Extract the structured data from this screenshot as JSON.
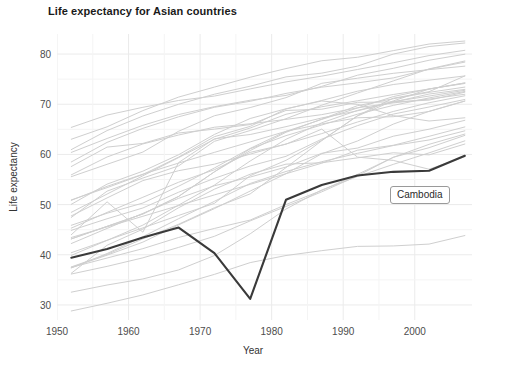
{
  "chart_data": {
    "type": "line",
    "title": "Life expectancy for Asian countries",
    "xlabel": "Year",
    "ylabel": "Life expectancy",
    "xlim": [
      1950,
      2008
    ],
    "ylim": [
      27,
      84
    ],
    "xticks": [
      1950,
      1960,
      1970,
      1980,
      1990,
      2000
    ],
    "yticks": [
      30,
      40,
      50,
      60,
      70,
      80
    ],
    "grid": true,
    "legend": "none",
    "annotations": [
      {
        "label": "Cambodia",
        "x": 1994,
        "y": 52.5
      }
    ],
    "highlight_series": "Cambodia",
    "x": [
      1952,
      1957,
      1962,
      1967,
      1972,
      1977,
      1982,
      1987,
      1992,
      1997,
      2002,
      2007
    ],
    "series": [
      {
        "name": "Cambodia",
        "highlight": true,
        "values": [
          39.42,
          41.17,
          43.42,
          45.42,
          40.32,
          31.22,
          50.96,
          53.91,
          55.8,
          56.53,
          56.75,
          59.72
        ]
      },
      {
        "name": "Afghanistan",
        "highlight": false,
        "values": [
          28.8,
          30.33,
          32.0,
          34.02,
          36.09,
          38.44,
          39.85,
          40.82,
          41.67,
          41.76,
          42.13,
          43.83
        ]
      },
      {
        "name": "Bahrain",
        "highlight": false,
        "values": [
          50.94,
          53.38,
          56.0,
          59.47,
          63.54,
          65.59,
          69.05,
          70.75,
          72.6,
          73.93,
          74.8,
          75.64
        ]
      },
      {
        "name": "Bangladesh",
        "highlight": false,
        "values": [
          37.48,
          39.35,
          41.22,
          43.45,
          45.25,
          46.92,
          50.01,
          52.82,
          56.02,
          59.41,
          62.01,
          64.06
        ]
      },
      {
        "name": "China",
        "highlight": false,
        "values": [
          44.0,
          50.55,
          44.5,
          58.38,
          63.12,
          63.97,
          65.53,
          67.27,
          68.69,
          70.43,
          72.03,
          72.96
        ]
      },
      {
        "name": "Hong Kong, China",
        "highlight": false,
        "values": [
          60.96,
          64.75,
          67.65,
          70.0,
          72.0,
          73.6,
          75.45,
          76.2,
          77.6,
          80.0,
          81.5,
          82.21
        ]
      },
      {
        "name": "India",
        "highlight": false,
        "values": [
          37.37,
          40.25,
          43.61,
          47.19,
          50.65,
          54.21,
          56.6,
          58.55,
          60.22,
          61.77,
          62.88,
          64.7
        ]
      },
      {
        "name": "Indonesia",
        "highlight": false,
        "values": [
          37.47,
          39.92,
          42.52,
          45.96,
          49.2,
          52.7,
          56.16,
          60.14,
          62.68,
          66.04,
          68.59,
          70.65
        ]
      },
      {
        "name": "Iran",
        "highlight": false,
        "values": [
          44.87,
          47.18,
          49.33,
          52.47,
          55.23,
          57.7,
          59.62,
          63.04,
          65.74,
          68.04,
          69.45,
          70.96
        ]
      },
      {
        "name": "Iraq",
        "highlight": false,
        "values": [
          45.32,
          48.44,
          51.46,
          54.46,
          56.95,
          60.41,
          62.04,
          65.04,
          59.46,
          58.81,
          57.05,
          59.55
        ]
      },
      {
        "name": "Israel",
        "highlight": false,
        "values": [
          65.39,
          67.84,
          69.39,
          70.75,
          71.63,
          73.06,
          74.45,
          75.6,
          76.93,
          78.27,
          79.7,
          80.75
        ]
      },
      {
        "name": "Japan",
        "highlight": false,
        "values": [
          63.03,
          65.5,
          68.73,
          71.43,
          73.42,
          75.38,
          77.11,
          78.67,
          79.36,
          80.69,
          82.0,
          82.6
        ]
      },
      {
        "name": "Jordan",
        "highlight": false,
        "values": [
          43.16,
          45.67,
          48.13,
          51.63,
          56.53,
          61.13,
          63.74,
          65.87,
          68.02,
          69.77,
          71.26,
          72.54
        ]
      },
      {
        "name": "Korea, Dem. Rep.",
        "highlight": false,
        "values": [
          50.06,
          54.08,
          56.66,
          59.94,
          63.98,
          67.16,
          69.1,
          70.65,
          69.98,
          67.73,
          66.66,
          67.3
        ]
      },
      {
        "name": "Korea, Rep.",
        "highlight": false,
        "values": [
          47.45,
          52.68,
          55.29,
          57.72,
          62.61,
          64.77,
          67.12,
          69.81,
          72.24,
          74.65,
          77.04,
          78.62
        ]
      },
      {
        "name": "Kuwait",
        "highlight": false,
        "values": [
          55.57,
          58.03,
          60.47,
          64.62,
          67.71,
          69.34,
          71.31,
          74.17,
          75.19,
          76.16,
          76.9,
          77.59
        ]
      },
      {
        "name": "Lebanon",
        "highlight": false,
        "values": [
          55.93,
          59.49,
          62.09,
          63.87,
          65.42,
          66.1,
          66.98,
          67.93,
          69.29,
          70.27,
          71.03,
          71.99
        ]
      },
      {
        "name": "Malaysia",
        "highlight": false,
        "values": [
          48.46,
          52.1,
          55.74,
          59.37,
          63.01,
          65.26,
          68.0,
          69.5,
          70.69,
          71.94,
          73.04,
          74.24
        ]
      },
      {
        "name": "Mongolia",
        "highlight": false,
        "values": [
          42.24,
          45.25,
          48.25,
          51.25,
          53.75,
          55.49,
          57.49,
          60.22,
          61.27,
          63.63,
          65.03,
          66.8
        ]
      },
      {
        "name": "Myanmar",
        "highlight": false,
        "values": [
          36.32,
          41.9,
          45.11,
          49.38,
          53.07,
          56.06,
          58.06,
          58.34,
          59.32,
          60.33,
          59.91,
          62.07
        ]
      },
      {
        "name": "Nepal",
        "highlight": false,
        "values": [
          36.16,
          37.69,
          39.39,
          41.47,
          43.68,
          46.75,
          49.63,
          52.54,
          55.73,
          59.43,
          61.34,
          63.79
        ]
      },
      {
        "name": "Oman",
        "highlight": false,
        "values": [
          37.58,
          40.08,
          43.17,
          46.09,
          49.38,
          52.14,
          57.37,
          62.73,
          67.73,
          71.2,
          72.5,
          75.64
        ]
      },
      {
        "name": "Pakistan",
        "highlight": false,
        "values": [
          43.44,
          45.56,
          47.67,
          49.8,
          51.93,
          54.04,
          56.16,
          58.25,
          60.84,
          61.82,
          63.61,
          65.48
        ]
      },
      {
        "name": "Philippines",
        "highlight": false,
        "values": [
          47.75,
          51.33,
          54.78,
          56.76,
          58.06,
          60.06,
          62.08,
          64.15,
          66.46,
          68.56,
          70.3,
          71.69
        ]
      },
      {
        "name": "Saudi Arabia",
        "highlight": false,
        "values": [
          39.88,
          42.87,
          45.91,
          49.9,
          53.89,
          58.69,
          63.01,
          66.3,
          68.77,
          70.53,
          71.63,
          72.78
        ]
      },
      {
        "name": "Singapore",
        "highlight": false,
        "values": [
          60.4,
          63.18,
          65.8,
          67.95,
          69.52,
          70.8,
          71.76,
          73.56,
          75.79,
          77.16,
          78.77,
          79.97
        ]
      },
      {
        "name": "Sri Lanka",
        "highlight": false,
        "values": [
          57.59,
          61.46,
          62.19,
          64.27,
          65.04,
          65.95,
          68.76,
          69.01,
          70.38,
          70.46,
          70.82,
          72.4
        ]
      },
      {
        "name": "Syria",
        "highlight": false,
        "values": [
          45.88,
          48.28,
          50.31,
          53.66,
          57.3,
          61.2,
          64.59,
          66.97,
          69.25,
          71.53,
          73.05,
          74.14
        ]
      },
      {
        "name": "Taiwan",
        "highlight": false,
        "values": [
          58.5,
          62.4,
          65.2,
          67.5,
          69.39,
          70.59,
          72.16,
          73.4,
          74.26,
          75.25,
          76.99,
          78.4
        ]
      },
      {
        "name": "Thailand",
        "highlight": false,
        "values": [
          50.85,
          53.64,
          56.06,
          58.28,
          60.41,
          62.49,
          64.6,
          66.08,
          67.3,
          67.52,
          68.56,
          70.62
        ]
      },
      {
        "name": "Vietnam",
        "highlight": false,
        "values": [
          40.41,
          42.89,
          45.36,
          47.84,
          50.25,
          55.76,
          58.82,
          62.82,
          67.66,
          70.67,
          73.02,
          74.25
        ]
      },
      {
        "name": "West Bank and Gaza",
        "highlight": false,
        "values": [
          43.16,
          45.67,
          48.13,
          51.63,
          56.53,
          60.77,
          64.41,
          67.05,
          69.72,
          71.1,
          72.37,
          73.42
        ]
      },
      {
        "name": "Yemen, Rep.",
        "highlight": false,
        "values": [
          32.55,
          33.97,
          35.18,
          36.98,
          39.85,
          44.18,
          49.11,
          52.92,
          55.6,
          58.02,
          60.31,
          62.7
        ]
      }
    ]
  },
  "axis": {
    "yticks_text": [
      "80",
      "70",
      "60",
      "50",
      "40",
      "30"
    ],
    "xticks_text": [
      "1950",
      "1960",
      "1970",
      "1980",
      "1990",
      "2000"
    ]
  },
  "colors": {
    "background": "#ffffff",
    "grid": "#ebebeb",
    "line_default": "#cfcfcf",
    "line_highlight": "#3a3a3a",
    "text": "#4d4d4d",
    "title": "#1a1a1a",
    "annotation_border": "#9a9a9a"
  }
}
